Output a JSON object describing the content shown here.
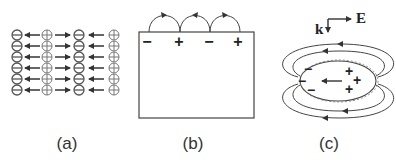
{
  "panels": {
    "a": {
      "caption": "(a)",
      "rows": 6,
      "pattern": [
        "negative",
        "arrow-left",
        "positive",
        "arrow-right",
        "negative",
        "arrow-left",
        "positive"
      ]
    },
    "b": {
      "caption": "(b)",
      "surface_charges": [
        "−",
        "+",
        "−",
        "+"
      ]
    },
    "c": {
      "caption": "(c)",
      "wave_vector_label": "k",
      "field_label": "E",
      "left_charges": [
        "−",
        "−",
        "−"
      ],
      "right_charges": [
        "+",
        "+",
        "+"
      ]
    }
  },
  "colors": {
    "stroke": "#333333",
    "text": "#333333"
  }
}
